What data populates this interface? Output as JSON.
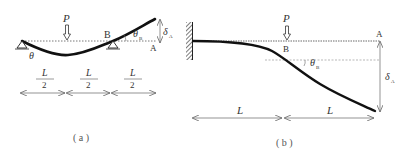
{
  "figure_a": {
    "load_label": "P",
    "point_b_label": "B",
    "point_a_label": "A",
    "theta_label": "θ",
    "theta_b_label": "θ",
    "theta_b_sub": "B",
    "delta_a_label": "δ",
    "delta_a_sub": "A",
    "span_labels": [
      {
        "num": "L",
        "den": "2"
      },
      {
        "num": "L",
        "den": "2"
      },
      {
        "num": "L",
        "den": "2"
      }
    ],
    "caption": "( a )"
  },
  "figure_b": {
    "load_label": "P",
    "point_b_label": "B",
    "point_a_label": "A",
    "theta_b_label": "θ",
    "theta_b_sub": "B",
    "delta_a_label": "δ",
    "delta_a_sub": "A",
    "span_labels": [
      "L",
      "L"
    ],
    "caption": "( b )"
  },
  "colors": {
    "beam": "#111111",
    "line": "#555555",
    "text": "#333333"
  }
}
